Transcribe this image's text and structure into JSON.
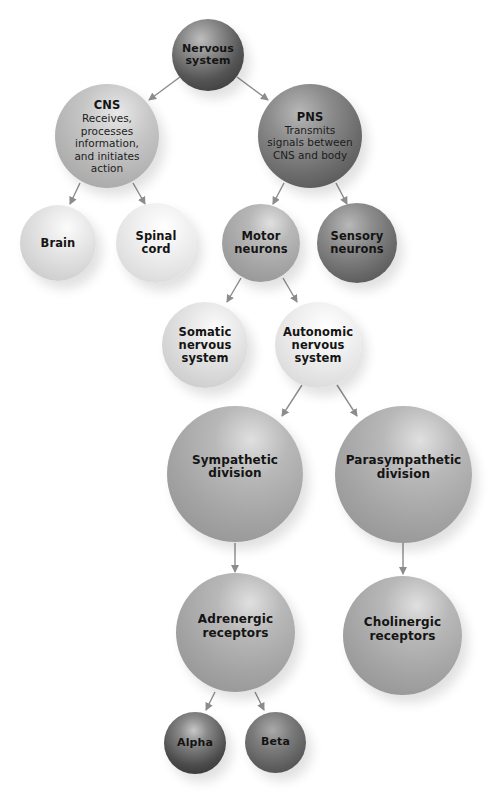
{
  "diagram": {
    "type": "hierarchy",
    "colors": {
      "arrow": "#8c8c8c",
      "text": "#141414",
      "background": "#ffffff"
    },
    "nodes": {
      "nervous_system": {
        "title": "Nervous\nsystem",
        "desc": ""
      },
      "cns": {
        "title": "CNS",
        "desc": "Receives,\nprocesses\ninformation,\nand initiates\naction"
      },
      "pns": {
        "title": "PNS",
        "desc": "Transmits\nsignals between\nCNS and body"
      },
      "brain": {
        "title": "Brain",
        "desc": ""
      },
      "spinal_cord": {
        "title": "Spinal\ncord",
        "desc": ""
      },
      "motor_neurons": {
        "title": "Motor\nneurons",
        "desc": ""
      },
      "sensory_neurons": {
        "title": "Sensory\nneurons",
        "desc": ""
      },
      "somatic": {
        "title": "Somatic\nnervous\nsystem",
        "desc": ""
      },
      "autonomic": {
        "title": "Autonomic\nnervous\nsystem",
        "desc": ""
      },
      "sympathetic": {
        "title": "Sympathetic\ndivision",
        "desc": ""
      },
      "parasympathetic": {
        "title": "Parasympathetic\ndivision",
        "desc": ""
      },
      "adrenergic": {
        "title": "Adrenergic\nreceptors",
        "desc": ""
      },
      "cholinergic": {
        "title": "Cholinergic\nreceptors",
        "desc": ""
      },
      "alpha": {
        "title": "Alpha",
        "desc": ""
      },
      "beta": {
        "title": "Beta",
        "desc": ""
      }
    },
    "edges": [
      {
        "from": "Nervous system",
        "to": "CNS"
      },
      {
        "from": "Nervous system",
        "to": "PNS"
      },
      {
        "from": "CNS",
        "to": "Brain"
      },
      {
        "from": "CNS",
        "to": "Spinal cord"
      },
      {
        "from": "PNS",
        "to": "Motor neurons"
      },
      {
        "from": "PNS",
        "to": "Sensory neurons"
      },
      {
        "from": "Motor neurons",
        "to": "Somatic nervous system"
      },
      {
        "from": "Motor neurons",
        "to": "Autonomic nervous system"
      },
      {
        "from": "Autonomic nervous system",
        "to": "Sympathetic division"
      },
      {
        "from": "Autonomic nervous system",
        "to": "Parasympathetic division"
      },
      {
        "from": "Sympathetic division",
        "to": "Adrenergic receptors"
      },
      {
        "from": "Parasympathetic division",
        "to": "Cholinergic receptors"
      },
      {
        "from": "Adrenergic receptors",
        "to": "Alpha"
      },
      {
        "from": "Adrenergic receptors",
        "to": "Beta"
      }
    ]
  }
}
